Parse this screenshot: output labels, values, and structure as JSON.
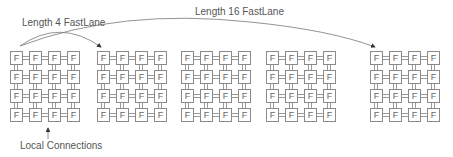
{
  "labels": {
    "length4": "Length 4 FastLane",
    "length16": "Length 16 FastLane",
    "local": "Local Connections"
  },
  "tile_label": "F",
  "grids": [
    {
      "id": "grid-1",
      "x": 10
    },
    {
      "id": "grid-2",
      "x": 97
    },
    {
      "id": "grid-3",
      "x": 181
    },
    {
      "id": "grid-4",
      "x": 266
    },
    {
      "id": "grid-5",
      "x": 370
    }
  ],
  "grid_rows": 4,
  "grid_cols": 4,
  "colors": {
    "line": "#8a8a8a",
    "text": "#555555"
  }
}
